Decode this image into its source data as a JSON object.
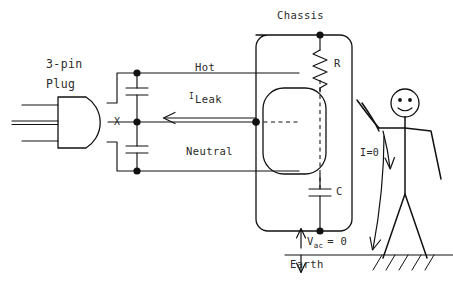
{
  "diagram": {
    "title_shown": false,
    "background_color": "#ffffff",
    "ink_color": "#111111",
    "labels": {
      "plug_line1": "3-pin",
      "plug_line2": "Plug",
      "node_x": "X",
      "hot": "Hot",
      "neutral": "Neutral",
      "leak_symbol": "I",
      "leak_word": "Leak",
      "chassis": "Chassis",
      "resistor": "R",
      "capacitor": "C",
      "vac_symbol": "V",
      "vac_subscript": "ac",
      "vac_equals": "= 0",
      "current_zero": "I=0",
      "earth": "Earth"
    },
    "components": [
      {
        "name": "three-pin-plug",
        "label": "3-pin Plug",
        "pins": 3
      },
      {
        "name": "capacitor-upper",
        "between": [
          "Hot",
          "X"
        ]
      },
      {
        "name": "capacitor-lower",
        "between": [
          "X",
          "Neutral"
        ]
      },
      {
        "name": "resistor-r",
        "label": "R"
      },
      {
        "name": "capacitor-c",
        "label": "C"
      },
      {
        "name": "chassis-enclosure",
        "label": "Chassis"
      },
      {
        "name": "internal-device",
        "label": ""
      },
      {
        "name": "person-figure",
        "label": ""
      },
      {
        "name": "earth-ground",
        "label": "Earth"
      }
    ],
    "annotations": [
      {
        "name": "leak-current",
        "text": "I Leak",
        "direction": "left"
      },
      {
        "name": "body-current",
        "text": "I=0",
        "direction": "down"
      },
      {
        "name": "chassis-voltage",
        "text": "V ac = 0",
        "direction": "vertical"
      }
    ]
  }
}
